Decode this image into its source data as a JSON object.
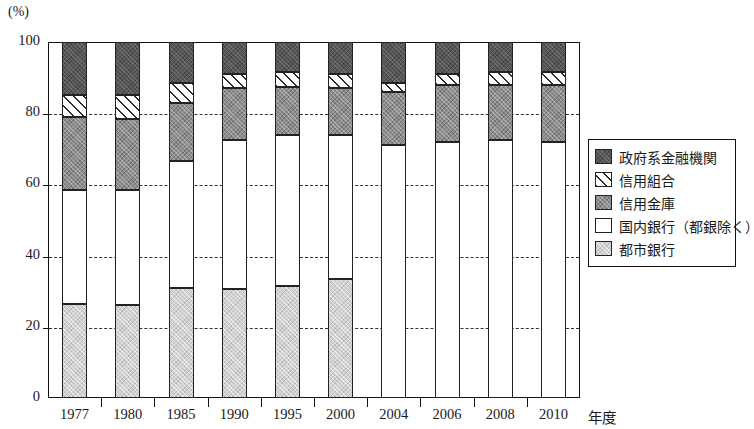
{
  "chart_data": {
    "type": "bar",
    "subtype": "stacked-100-percent",
    "title": "",
    "xlabel": "年度",
    "ylabel": "(%)",
    "ylim": [
      0,
      100
    ],
    "yticks": [
      0,
      20,
      40,
      60,
      80,
      100
    ],
    "ytick_labels": [
      "0",
      "20",
      "40",
      "60",
      "80",
      "100"
    ],
    "grid": "horizontal-dashed",
    "legend_position": "right",
    "categories": [
      "1977",
      "1980",
      "1985",
      "1990",
      "1995",
      "2000",
      "2004",
      "2006",
      "2008",
      "2010"
    ],
    "series": [
      {
        "name": "都市銀行",
        "key": "city",
        "color": "#d2d2d2",
        "pattern": "light-gray-fill",
        "values": [
          26.5,
          26.0,
          31.0,
          30.5,
          31.5,
          33.5,
          0,
          0,
          0,
          0
        ]
      },
      {
        "name": "国内銀行（都銀除く）",
        "key": "domestic",
        "color": "#ffffff",
        "pattern": "white-fill",
        "values": [
          32.0,
          32.5,
          35.5,
          42.0,
          42.5,
          40.5,
          71.0,
          72.0,
          72.5,
          72.0
        ]
      },
      {
        "name": "信用金庫",
        "key": "shinkin",
        "color": "#8d8d8d",
        "pattern": "medium-gray-fill",
        "values": [
          20.5,
          20.0,
          16.5,
          14.5,
          13.5,
          13.0,
          15.0,
          16.0,
          15.5,
          16.0
        ]
      },
      {
        "name": "信用組合",
        "key": "kumiai",
        "color": "#ffffff",
        "pattern": "diagonal-hatch",
        "values": [
          6.0,
          6.5,
          5.5,
          4.0,
          4.0,
          4.0,
          2.5,
          3.0,
          3.5,
          3.5
        ]
      },
      {
        "name": "政府系金融機関",
        "key": "gov",
        "color": "#565656",
        "pattern": "dark-gray-fill",
        "values": [
          15.0,
          15.0,
          11.5,
          9.0,
          8.5,
          9.0,
          11.5,
          9.0,
          8.5,
          8.5
        ]
      }
    ],
    "stack_tops": {
      "1977": [
        26.5,
        58.5,
        79.0,
        85.0,
        100
      ],
      "1980": [
        26.0,
        58.5,
        78.5,
        85.0,
        100
      ],
      "1985": [
        31.0,
        66.5,
        83.0,
        88.5,
        100
      ],
      "1990": [
        30.5,
        72.5,
        87.0,
        91.0,
        100
      ],
      "1995": [
        31.5,
        74.0,
        87.5,
        91.5,
        100
      ],
      "2000": [
        33.5,
        74.0,
        87.0,
        91.0,
        100
      ],
      "2004": [
        0,
        71.0,
        86.0,
        88.5,
        100
      ],
      "2006": [
        0,
        72.0,
        88.0,
        91.0,
        100
      ],
      "2008": [
        0,
        72.5,
        88.0,
        91.5,
        100
      ],
      "2010": [
        0,
        72.0,
        88.0,
        91.5,
        100
      ]
    }
  },
  "axes": {
    "unit_label": "(%)",
    "x_title": "年度",
    "y_tick_labels": [
      "0",
      "20",
      "40",
      "60",
      "80",
      "100"
    ],
    "x_tick_labels": [
      "1977",
      "1980",
      "1985",
      "1990",
      "1995",
      "2000",
      "2004",
      "2006",
      "2008",
      "2010"
    ]
  },
  "legend": {
    "items": [
      {
        "label": "政府系金融機関",
        "swatch": "dark-gray-swatch"
      },
      {
        "label": "信用組合",
        "swatch": "hatch-swatch"
      },
      {
        "label": "信用金庫",
        "swatch": "medium-gray-swatch"
      },
      {
        "label": "国内銀行（都銀除く）",
        "swatch": "white-swatch"
      },
      {
        "label": "都市銀行",
        "swatch": "light-gray-swatch"
      }
    ]
  },
  "colors": {
    "gov": "#565656",
    "kumiai": "#ffffff",
    "shinkin": "#8d8d8d",
    "domestic": "#ffffff",
    "city": "#d2d2d2",
    "axis": "#111111",
    "grid": "#333333"
  }
}
